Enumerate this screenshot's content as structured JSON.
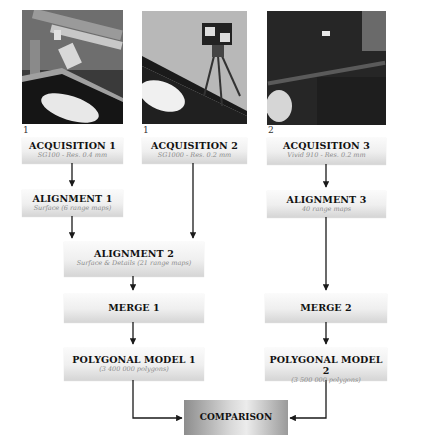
{
  "columns": [
    {
      "photo": "scanner-photo-1",
      "number": "1",
      "acquisition": {
        "title": "ACQUISITION 1",
        "subtitle": "SG100 - Res. 0.4 mm"
      }
    },
    {
      "photo": "scanner-photo-2",
      "number": "1",
      "acquisition": {
        "title": "ACQUISITION 2",
        "subtitle": "SG1000 - Res. 0.2 mm"
      }
    },
    {
      "photo": "scanner-photo-3",
      "number": "2",
      "acquisition": {
        "title": "ACQUISITION 3",
        "subtitle": "Vivid 910 - Res. 0.2 mm"
      }
    }
  ],
  "nodes": {
    "alignment1": {
      "title": "ALIGNMENT 1",
      "subtitle": "Surface (6 range maps)"
    },
    "alignment2": {
      "title": "ALIGNMENT 2",
      "subtitle": "Surface & Details (21 range maps)"
    },
    "alignment3": {
      "title": "ALIGNMENT 3",
      "subtitle": "40 range maps"
    },
    "merge1": {
      "title": "MERGE 1"
    },
    "merge2": {
      "title": "MERGE 2"
    },
    "model1": {
      "title": "POLYGONAL MODEL 1",
      "subtitle": "(3 400 000 polygons)"
    },
    "model2": {
      "title": "POLYGONAL MODEL 2",
      "subtitle": "(3 500 000 polygons)"
    },
    "comparison": {
      "title": "COMPARISON"
    }
  },
  "colors": {
    "arrow": "#1a1a1a",
    "box_top": "#fbfbfb",
    "box_bottom": "#d6d6d6",
    "subtitle": "#8a8a8a"
  }
}
